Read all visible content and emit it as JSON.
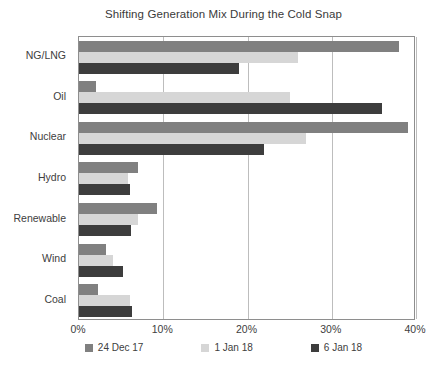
{
  "chart_data": {
    "type": "bar",
    "orientation": "horizontal",
    "title": "Shifting Generation Mix During the Cold Snap",
    "xlabel": "",
    "ylabel": "",
    "categories": [
      "NG/LNG",
      "Oil",
      "Nuclear",
      "Hydro",
      "Renewable",
      "Wind",
      "Coal"
    ],
    "xlim": [
      0,
      40
    ],
    "xticks": [
      0,
      10,
      20,
      30,
      40
    ],
    "xtick_labels": [
      "0%",
      "10%",
      "20%",
      "30%",
      "40%"
    ],
    "grid": "vertical",
    "legend_position": "bottom",
    "series": [
      {
        "name": "24 Dec 17",
        "color": "#808080",
        "values": [
          38.0,
          2.0,
          39.0,
          7.0,
          9.2,
          3.2,
          2.2
        ]
      },
      {
        "name": "1 Jan 18",
        "color": "#d6d6d6",
        "values": [
          26.0,
          25.0,
          27.0,
          5.8,
          7.0,
          4.0,
          6.0
        ]
      },
      {
        "name": "6 Jan 18",
        "color": "#3d3d3d",
        "values": [
          19.0,
          36.0,
          22.0,
          6.0,
          6.2,
          5.2,
          6.3
        ]
      }
    ]
  }
}
